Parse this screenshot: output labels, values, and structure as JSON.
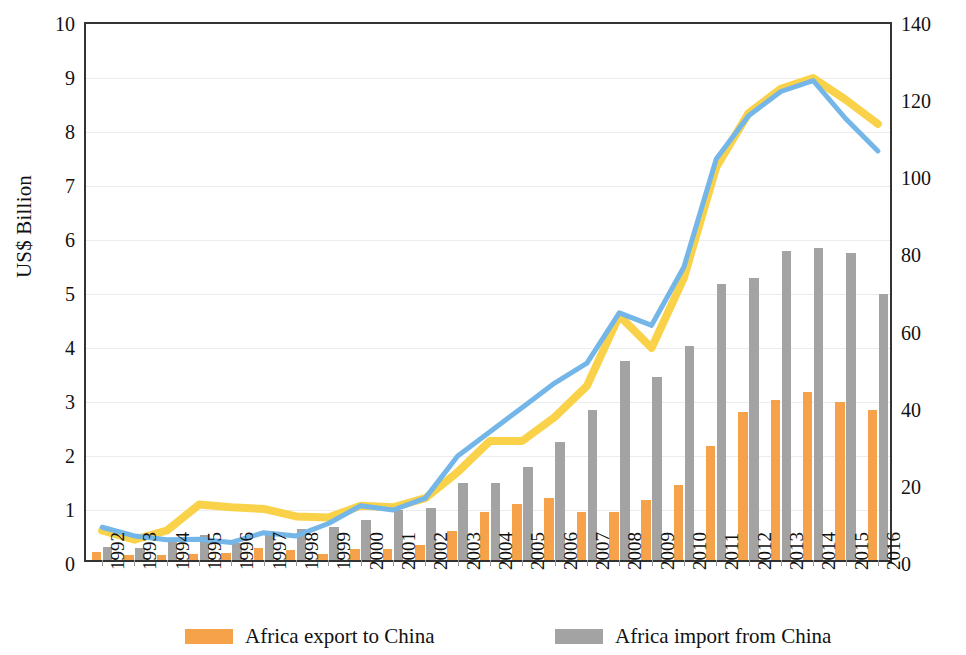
{
  "chart_data": {
    "type": "bar",
    "title": "",
    "subtitle": "",
    "xlabel": "",
    "ylabel": "US$ Billion",
    "y2label": "",
    "grid": true,
    "legend_position": "bottom",
    "ylim": [
      0,
      10
    ],
    "y2lim": [
      0,
      140
    ],
    "y_ticks": [
      "0",
      "1",
      "2",
      "3",
      "4",
      "5",
      "6",
      "7",
      "8",
      "9",
      "10"
    ],
    "y2_ticks": [
      "0",
      "20",
      "40",
      "60",
      "80",
      "100",
      "120",
      "140"
    ],
    "categories": [
      "1992",
      "1993",
      "1994",
      "1995",
      "1996",
      "1997",
      "1998",
      "1999",
      "2000",
      "2001",
      "2002",
      "2003",
      "2004",
      "2005",
      "2006",
      "2007",
      "2008",
      "2009",
      "2010",
      "2011",
      "2012",
      "2013",
      "2014",
      "2015",
      "2016"
    ],
    "series": [
      {
        "name": "Africa export to China",
        "type": "bar",
        "axis": "right",
        "color": "#F5A24B",
        "values": [
          2.0,
          1.2,
          1.2,
          1.5,
          1.8,
          3.0,
          2.5,
          1.5,
          2.8,
          2.8,
          4.0,
          7.5,
          12.5,
          14.5,
          16.0,
          12.5,
          12.5,
          15.5,
          19.5,
          29.5,
          38.5,
          41.5,
          43.5,
          41.0,
          39.0
        ]
      },
      {
        "name": "Africa import from China",
        "type": "bar",
        "axis": "right",
        "color": "#A3A3A3",
        "values": [
          3.5,
          3.0,
          5.5,
          6.5,
          4.5,
          7.5,
          8.0,
          8.5,
          10.5,
          13.0,
          13.5,
          20.0,
          20.0,
          24.0,
          30.5,
          39.0,
          51.5,
          47.5,
          55.5,
          71.5,
          73.0,
          80.0,
          81.0,
          79.5,
          69.0
        ]
      },
      {
        "name": "line-yellow",
        "type": "line",
        "axis": "left",
        "color": "#FAD24A",
        "values": [
          0.62,
          0.45,
          0.62,
          1.1,
          1.05,
          1.02,
          0.88,
          0.86,
          1.08,
          1.05,
          1.22,
          1.7,
          2.28,
          2.28,
          2.72,
          3.3,
          4.6,
          4.0,
          5.3,
          7.35,
          8.35,
          8.8,
          9.0,
          8.6,
          8.15
        ]
      },
      {
        "name": "line-blue",
        "type": "line",
        "axis": "left",
        "color": "#74B6E8",
        "values": [
          0.68,
          0.52,
          0.45,
          0.46,
          0.4,
          0.58,
          0.52,
          0.75,
          1.08,
          1.0,
          1.22,
          2.0,
          2.45,
          2.9,
          3.35,
          3.72,
          4.65,
          4.42,
          5.5,
          7.5,
          8.3,
          8.75,
          8.95,
          8.25,
          7.65
        ]
      }
    ],
    "legend": [
      {
        "label": "Africa export to China",
        "color": "#F5A24B",
        "swatch": "export"
      },
      {
        "label": "Africa import from China",
        "color": "#A3A3A3",
        "swatch": "import"
      }
    ]
  }
}
